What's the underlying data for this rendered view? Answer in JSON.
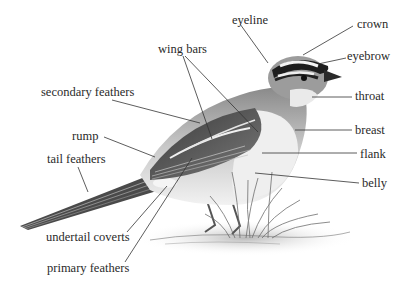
{
  "diagram": {
    "labels": {
      "eyeline": "eyeline",
      "crown": "crown",
      "wing_bars": "wing bars",
      "eyebrow": "eyebrow",
      "secondary_feathers": "secondary feathers",
      "throat": "throat",
      "rump": "rump",
      "breast": "breast",
      "tail_feathers": "tail feathers",
      "flank": "flank",
      "belly": "belly",
      "undertail_coverts": "undertail coverts",
      "primary_feathers": "primary feathers"
    },
    "colors": {
      "background": "#ffffff",
      "label_text": "#2a2a2a",
      "leader_line": "#333333"
    }
  }
}
